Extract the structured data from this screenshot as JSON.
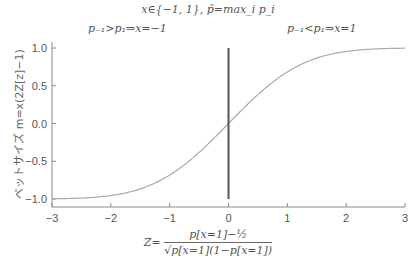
{
  "chart_data": {
    "type": "line",
    "title": "x∈{−1, 1}, p̃=max_i p_i",
    "annotations": [
      {
        "text": "p₋₁>p₁⇒x=−1",
        "position": "top-left"
      },
      {
        "text": "p₋₁<p₁⇒x=1",
        "position": "top-right"
      }
    ],
    "xlabel": "Z = (p[x=1] − 1/2) / √(p[x=1](1−p[x=1]))",
    "xlabel_parts": {
      "lhs": "Z=",
      "numerator": "p[x=1]−½",
      "denominator": "√p[x=1](1−p[x=1])"
    },
    "ylabel": "ベットサイズ m=x(2Z[z]−1)",
    "xlim": [
      -3,
      3
    ],
    "ylim": [
      -1.0,
      1.0
    ],
    "xticks": [
      -3,
      -2,
      -1,
      0,
      1,
      2,
      3
    ],
    "xtick_labels": [
      "−3",
      "−2",
      "−1",
      "0",
      "1",
      "2",
      "3"
    ],
    "yticks": [
      1.0,
      0.5,
      0.0,
      -0.5,
      -1.0
    ],
    "ytick_labels": [
      "1.0",
      "0.5",
      "0.0",
      "−0.5",
      "−1.0"
    ],
    "grid": false,
    "series": [
      {
        "name": "bet size",
        "function": "2*Phi(z)-1",
        "x": [
          -3,
          -2.5,
          -2,
          -1.5,
          -1,
          -0.75,
          -0.5,
          -0.25,
          0,
          0.25,
          0.5,
          0.75,
          1,
          1.5,
          2,
          2.5,
          3
        ],
        "y": [
          -0.997,
          -0.988,
          -0.954,
          -0.866,
          -0.683,
          -0.547,
          -0.383,
          -0.197,
          0.0,
          0.197,
          0.383,
          0.547,
          0.683,
          0.866,
          0.954,
          0.988,
          0.997
        ],
        "color": "#aaaaaa"
      }
    ],
    "vertical_line": {
      "x": 0,
      "ymin": -1.0,
      "ymax": 1.0,
      "color": "#555555"
    }
  }
}
